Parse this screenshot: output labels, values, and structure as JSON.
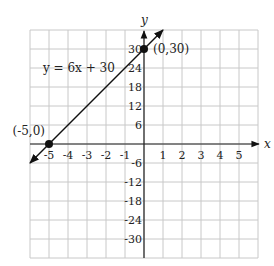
{
  "chart_data": {
    "type": "line",
    "title": "",
    "xlabel": "x",
    "ylabel": "y",
    "equation_label": "y = 6x + 30",
    "equation": {
      "slope": 6,
      "intercept": 30
    },
    "xlim": [
      -6,
      6
    ],
    "ylim": [
      -36,
      36
    ],
    "grid": true,
    "x_ticks": [
      -5,
      -4,
      -3,
      -2,
      -1,
      1,
      2,
      3,
      4,
      5
    ],
    "x_tick_labels": [
      "-5",
      "-4",
      "-3",
      "-2",
      "-1",
      "1",
      "2",
      "3",
      "4",
      "5"
    ],
    "y_ticks": [
      30,
      24,
      18,
      12,
      6,
      -6,
      -12,
      -18,
      -24,
      -30
    ],
    "y_tick_labels": [
      "30",
      "24",
      "18",
      "12",
      "6",
      "-6",
      "-12",
      "-18",
      "-24",
      "-30"
    ],
    "series": [
      {
        "name": "y = 6x + 30",
        "x": [
          -6,
          1
        ],
        "y": [
          -6,
          36
        ],
        "arrows": "both"
      }
    ],
    "points": [
      {
        "x": 0,
        "y": 30,
        "label": "(0,30)"
      },
      {
        "x": -5,
        "y": 0,
        "label": "(-5,0)"
      }
    ],
    "colors": {
      "grid": "#c8c8c8",
      "axis": "#222222",
      "line": "#111111",
      "point": "#111111"
    }
  }
}
